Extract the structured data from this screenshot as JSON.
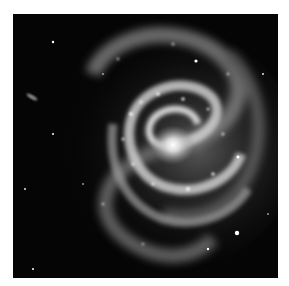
{
  "image": {
    "subject": "spiral galaxy",
    "mode": "grayscale",
    "background_color": "#ffffff",
    "space_color": "#050505",
    "core": {
      "x": 160,
      "y": 131
    },
    "features": [
      "bright core",
      "spiral arms",
      "foreground stars",
      "small edge-on galaxy at left"
    ]
  }
}
